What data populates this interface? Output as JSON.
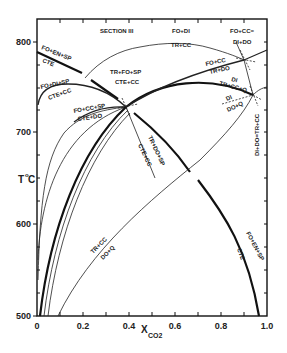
{
  "figure": {
    "section_title": "SECTION III",
    "y_axis": {
      "title": "T",
      "title_sup": "o",
      "title_unit": "C",
      "ticks": [
        "800",
        "700",
        "600",
        "500"
      ],
      "range": [
        500,
        825
      ]
    },
    "x_axis": {
      "title": "X",
      "title_sub": "CO2",
      "ticks": [
        "0",
        "0.2",
        "0.4",
        "0.6",
        "0.8",
        "1.0"
      ],
      "range": [
        0,
        1.0
      ]
    },
    "reactions": {
      "fo_en_sp_top": "FO+EN+SP",
      "cte_top": "CTE",
      "fo_di_sp": "FO+DI+SP",
      "cte_cc_left": "CTE+CC",
      "fo_cc_sp": "FO+CC+SP",
      "cte_do": "CTE+DO",
      "tr_fo_sp": "TR+FO+SP",
      "cte_cc_mid": "CTE+CC",
      "fo_di": "FO+DI",
      "tr_cc_top": "TR+CC",
      "fo_cc_eq": "FO+CC=",
      "di_do": "DI+DO",
      "fo_cc_right": "FO+CC",
      "tr_do": "TR+DO",
      "di": "DI",
      "tr_cc_q": "TR+CC+Q",
      "di_small": "DI",
      "do_q_small": "DO+Q",
      "di_do_tr_cc": "DI+DO=TR+CC",
      "tr_do_sp": "TR+DO+SP",
      "cte_cc_diag": "CTE+CC",
      "tr_cc_low": "TR+CC",
      "do_q_low": "DO+Q",
      "fo_en_sp_right": "FO+EN+SP",
      "cte_right": "CTE"
    }
  }
}
